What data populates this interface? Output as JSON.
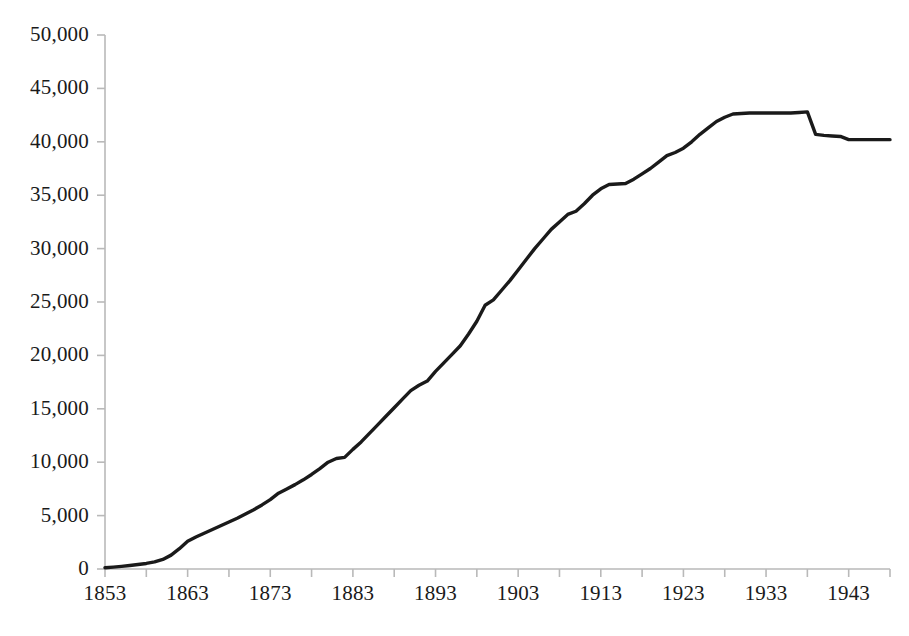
{
  "chart_data": {
    "type": "line",
    "title": "",
    "subtitle": "",
    "xlabel": "",
    "ylabel": "",
    "xlim": [
      1853,
      1948
    ],
    "ylim": [
      0,
      50000
    ],
    "grid": false,
    "legend": null,
    "y_ticks": [
      0,
      5000,
      10000,
      15000,
      20000,
      25000,
      30000,
      35000,
      40000,
      45000,
      50000
    ],
    "y_tick_labels": [
      "0",
      "5,000",
      "10,000",
      "15,000",
      "20,000",
      "25,000",
      "30,000",
      "35,000",
      "40,000",
      "45,000",
      "50,000"
    ],
    "x_ticks": [
      1853,
      1863,
      1873,
      1883,
      1893,
      1903,
      1913,
      1923,
      1933,
      1943
    ],
    "x_tick_labels": [
      "1853",
      "1863",
      "1873",
      "1883",
      "1893",
      "1903",
      "1913",
      "1923",
      "1933",
      "1943"
    ],
    "x_minor_tick_interval": 5,
    "line_color": "#1a1a1a",
    "line_width": 3.4,
    "axis_color": "#b9b9b9",
    "background_color": "#ffffff",
    "series": [
      {
        "name": "value",
        "x": [
          1853,
          1854,
          1855,
          1856,
          1857,
          1858,
          1859,
          1860,
          1861,
          1862,
          1863,
          1864,
          1865,
          1866,
          1867,
          1868,
          1869,
          1870,
          1871,
          1872,
          1873,
          1874,
          1875,
          1876,
          1877,
          1878,
          1879,
          1880,
          1881,
          1882,
          1883,
          1884,
          1885,
          1886,
          1887,
          1888,
          1889,
          1890,
          1891,
          1892,
          1893,
          1894,
          1895,
          1896,
          1897,
          1898,
          1899,
          1900,
          1901,
          1902,
          1903,
          1904,
          1905,
          1906,
          1907,
          1908,
          1909,
          1910,
          1911,
          1912,
          1913,
          1914,
          1915,
          1916,
          1917,
          1918,
          1919,
          1920,
          1921,
          1922,
          1923,
          1924,
          1925,
          1926,
          1927,
          1928,
          1929,
          1930,
          1931,
          1932,
          1933,
          1934,
          1935,
          1936,
          1937,
          1938,
          1939,
          1940,
          1941,
          1942,
          1943,
          1944,
          1945,
          1946,
          1947,
          1948
        ],
        "values": [
          120,
          180,
          250,
          330,
          420,
          520,
          660,
          900,
          1300,
          1900,
          2600,
          3000,
          3350,
          3700,
          4050,
          4400,
          4750,
          5150,
          5550,
          6000,
          6500,
          7100,
          7500,
          7900,
          8350,
          8850,
          9400,
          10000,
          10350,
          10450,
          11200,
          11900,
          12700,
          13500,
          14300,
          15100,
          15900,
          16700,
          17200,
          17600,
          18500,
          19300,
          20100,
          20900,
          22000,
          23200,
          24700,
          25200,
          26100,
          27000,
          28000,
          29000,
          30000,
          30900,
          31800,
          32500,
          33200,
          33500,
          34200,
          35000,
          35600,
          36000,
          36050,
          36100,
          36500,
          37000,
          37500,
          38100,
          38700,
          39000,
          39400,
          40000,
          40700,
          41300,
          41900,
          42300,
          42600,
          42650,
          42700,
          42700,
          42700,
          42700,
          42700,
          42700,
          42750,
          42800,
          40700,
          40600,
          40550,
          40500,
          40200,
          40200,
          40200,
          40200,
          40200,
          40200
        ]
      }
    ]
  },
  "axes": {
    "y_axis_name": "y-axis",
    "x_axis_name": "x-axis"
  }
}
